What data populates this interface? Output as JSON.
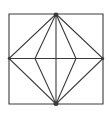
{
  "figure": {
    "background_color": "#ffffff",
    "stroke_color": "#3a3a3a",
    "stroke_width": 1.1,
    "canvas": {
      "width": 109,
      "height": 113
    },
    "polygons": [
      {
        "name": "outer-square",
        "points": "9,14 103,14 103,104 9,104"
      },
      {
        "name": "large-diamond",
        "points": "56,14 103,58.5 56,104 9,58.5"
      },
      {
        "name": "narrow-diamond",
        "points": "56,14 76,58.5 56,104 35,58.5"
      }
    ],
    "lines": [
      {
        "name": "horizontal-midline",
        "x1": 9,
        "y1": 58.5,
        "x2": 103,
        "y2": 58.5
      },
      {
        "name": "vertical-midline",
        "x1": 56,
        "y1": 14,
        "x2": 56,
        "y2": 104
      }
    ],
    "dots": [
      {
        "name": "top-vertex-dot",
        "cx": 56,
        "cy": 14.8,
        "r": 2.3
      },
      {
        "name": "bottom-vertex-dot",
        "cx": 56,
        "cy": 103.5,
        "r": 2.5
      },
      {
        "name": "left-midpoint-dot",
        "cx": 9.4,
        "cy": 58.3,
        "r": 1.6
      },
      {
        "name": "right-midpoint-dot",
        "cx": 102.6,
        "cy": 58.5,
        "r": 1.6
      }
    ]
  }
}
